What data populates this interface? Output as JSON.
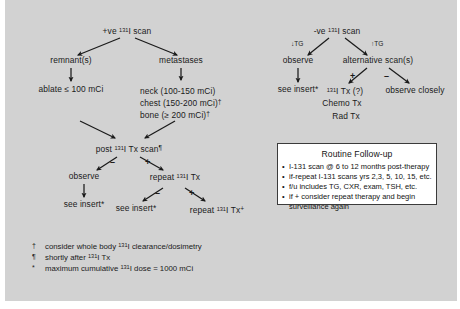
{
  "diagram": {
    "title_left": "+ve 131I scan",
    "title_right": "-ve 131I scan",
    "left_branch": {
      "root": {
        "pre": "+ve ",
        "sup": "131",
        "post": "I scan"
      },
      "children": [
        {
          "label": "remnant(s)"
        },
        {
          "label": "metastases"
        }
      ],
      "remnant_dose": "ablate ≤ 100 mCi",
      "metastases_doses": [
        {
          "text": "neck (100-150 mCi)",
          "mark": ""
        },
        {
          "text": "chest (150-200 mCi)",
          "mark": "†"
        },
        {
          "text": "bone (≥ 200 mCi)",
          "mark": "†"
        }
      ],
      "post_scan": {
        "pre": "post ",
        "sup": "131",
        "post": "I Tx scan",
        "mark": "¶"
      },
      "post_scan_neg_sign": "–",
      "post_scan_pos_sign": "+",
      "observe": "observe",
      "observe_next": "see insert*",
      "repeat_tx": {
        "pre": "repeat ",
        "sup": "131",
        "post": "I Tx"
      },
      "repeat_neg_sign": "–",
      "repeat_pos_sign": "+",
      "repeat_neg_out": "see insert*",
      "repeat_pos_out": {
        "pre": "repeat ",
        "sup": "131",
        "post": "I Tx",
        "mark": "+"
      }
    },
    "right_branch": {
      "root": {
        "pre": "-ve ",
        "sup": "131",
        "post": "I scan"
      },
      "left_label": "↓TG",
      "right_label": "↑TG",
      "observe": "observe",
      "observe_next": "see insert*",
      "alternative": "alternative scan(s)",
      "alt_pos_sign": "+",
      "alt_neg_sign": "–",
      "pos_outcomes": [
        {
          "pre": "",
          "sup": "131",
          "post": "I Tx (?)"
        },
        {
          "pre": "",
          "sup": "",
          "post": "Chemo Tx"
        },
        {
          "pre": "",
          "sup": "",
          "post": "Rad Tx"
        }
      ],
      "neg_outcome": "observe closely"
    },
    "footnotes": [
      {
        "sym": "†",
        "pre": "consider whole body ",
        "sup": "131",
        "post": "I clearance/dosimetry"
      },
      {
        "sym": "¶",
        "pre": "shortly after ",
        "sup": "131",
        "post": "I Tx"
      },
      {
        "sym": "*",
        "pre": "maximum cumulative ",
        "sup": "131",
        "post": "I dose = 1000 mCi"
      }
    ]
  },
  "followup": {
    "title": "Routine Follow-up",
    "items": [
      "I-131 scan @ 6 to 12 months post-therapy",
      "if-repeat I-131 scans yrs 2,3, 5, 10, 15, etc.",
      "f/u includes TG, CXR, exam, TSH, etc.",
      "if + consider repeat therapy and begin surveillance again"
    ]
  },
  "colors": {
    "panel_background": "#d2d2d2",
    "page_background": "#ffffff",
    "text": "#1a1a1a",
    "box_background": "#ffffff",
    "box_border": "#3b3b3b"
  }
}
